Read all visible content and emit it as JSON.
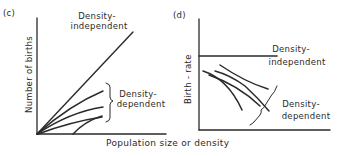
{
  "panel_c": {
    "tag": "(c)",
    "ylabel": "Number of births",
    "independent_label_1": "Density-",
    "independent_label_2": "independent",
    "dependent_label_1": "Density-",
    "dependent_label_2": "dependent"
  },
  "panel_d": {
    "tag": "(d)",
    "ylabel": "Birth - rate",
    "independent_label_1": "Density-",
    "independent_label_2": "independent",
    "dependent_label_1": "Density-",
    "dependent_label_2": "dependent"
  },
  "shared_xlabel": "Population size or density",
  "colors": {
    "ink": "#2a2a2a",
    "background": "#ffffff"
  }
}
